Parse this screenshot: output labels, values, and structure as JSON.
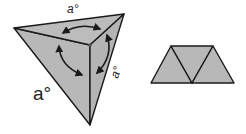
{
  "figure": {
    "type": "geometry-diagram",
    "colors": {
      "face_fill": "#b8b8b8",
      "edge": "#1a1a1a",
      "background": "#ffffff"
    }
  },
  "tetrahedron": {
    "labels": {
      "top": "a°",
      "right": "a°",
      "left": "a°"
    },
    "arrows": [
      {
        "name": "top-face-angle-arrow"
      },
      {
        "name": "left-face-angle-arrow"
      },
      {
        "name": "right-face-angle-arrow"
      }
    ]
  },
  "net": {
    "triangle_count": 3,
    "arrangement": "three adjacent equilateral triangles forming a trapezoid"
  }
}
